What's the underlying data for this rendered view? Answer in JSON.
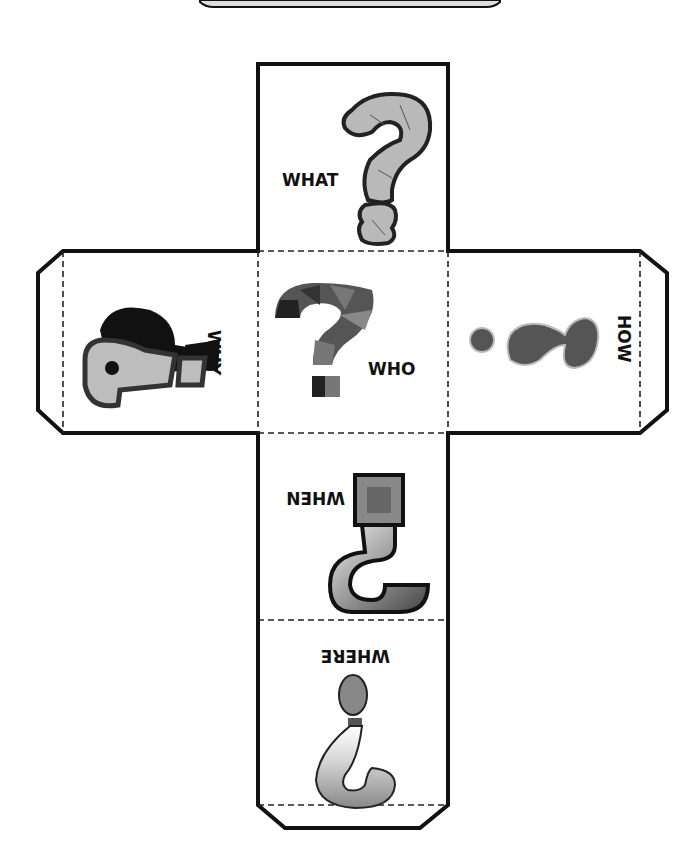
{
  "faces": {
    "what": {
      "label": "WHAT",
      "orientation": "upright"
    },
    "why": {
      "label": "WHY",
      "orientation": "rotated-90"
    },
    "who": {
      "label": "WHO",
      "orientation": "upright"
    },
    "how": {
      "label": "HOW",
      "orientation": "rotated-270"
    },
    "when": {
      "label": "WHEN",
      "orientation": "upside-down"
    },
    "where": {
      "label": "WHERE",
      "orientation": "upside-down"
    }
  },
  "colors": {
    "outline": "#111111",
    "fold_line": "#222222",
    "stone_fill": "#b9b9b9",
    "dark_fill": "#555555",
    "mid_fill": "#8a8a8a"
  }
}
